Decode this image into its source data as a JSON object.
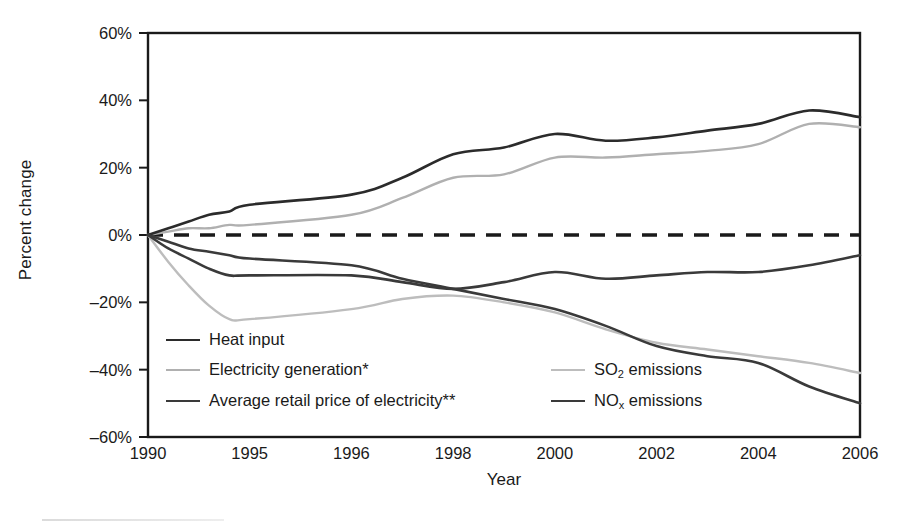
{
  "chart_data": {
    "type": "line",
    "title": "",
    "xlabel": "Year",
    "ylabel": "Percent change",
    "grid": false,
    "legend_position": "inside-bottom-left",
    "x_categories": [
      "1990",
      "1995",
      "1996",
      "1998",
      "2000",
      "2002",
      "2004",
      "2006"
    ],
    "x_note": "Category axis: tick labels evenly spaced although year intervals are unequal",
    "ylim": [
      -60,
      60
    ],
    "ytick_labels": [
      "60%",
      "40%",
      "20%",
      "0%",
      "-20%",
      "-40%",
      "-60%"
    ],
    "ytick_values": [
      60,
      40,
      20,
      0,
      -20,
      -40,
      -60
    ],
    "zero_reference_line": {
      "value": 0,
      "style": "dashed",
      "color": "#1a1a1a"
    },
    "series": [
      {
        "name": "Heat input",
        "color": "#2b2b2b",
        "width": 2.6,
        "values_at_ticks": [
          0,
          9,
          12,
          24,
          30,
          31,
          35,
          35
        ],
        "x": [
          1990,
          1991,
          1992,
          1993,
          1994,
          1995,
          1996,
          1997,
          1998,
          1999,
          2000,
          2001,
          2002,
          2003,
          2004,
          2005,
          2006
        ],
        "y": [
          0,
          2,
          4,
          6,
          7,
          9,
          12,
          17,
          24,
          26,
          30,
          28,
          29,
          31,
          33,
          37,
          35
        ]
      },
      {
        "name": "Electricity generation*",
        "color": "#b0b0b0",
        "width": 2.4,
        "values_at_ticks": [
          0,
          3,
          6,
          17,
          23,
          25,
          28,
          32
        ],
        "x": [
          1990,
          1991,
          1992,
          1993,
          1994,
          1995,
          1996,
          1997,
          1998,
          1999,
          2000,
          2001,
          2002,
          2003,
          2004,
          2005,
          2006
        ],
        "y": [
          0,
          1,
          2,
          2,
          3,
          3,
          6,
          11,
          17,
          18,
          23,
          23,
          24,
          25,
          27,
          33,
          32
        ]
      },
      {
        "name": "Average retail price of electricity**",
        "color": "#3a3a3a",
        "width": 2.6,
        "values_at_ticks": [
          0,
          -7,
          -9,
          -16,
          -22,
          -33,
          -38,
          -50
        ],
        "x": [
          1990,
          1991,
          1992,
          1993,
          1994,
          1995,
          1996,
          1997,
          1998,
          1999,
          2000,
          2001,
          2002,
          2003,
          2004,
          2005,
          2006
        ],
        "y": [
          0,
          -2,
          -4,
          -5,
          -6,
          -7,
          -9,
          -13,
          -16,
          -19,
          -22,
          -27,
          -33,
          -36,
          -38,
          -45,
          -50
        ]
      },
      {
        "name": "SO2 emissions",
        "color": "#bdbdbd",
        "width": 2.4,
        "values_at_ticks": [
          0,
          -25,
          -22,
          -18,
          -23,
          -32,
          -36,
          -41
        ],
        "x": [
          1990,
          1991,
          1992,
          1993,
          1994,
          1995,
          1996,
          1997,
          1998,
          1999,
          2000,
          2001,
          2002,
          2003,
          2004,
          2005,
          2006
        ],
        "y": [
          0,
          -8,
          -15,
          -21,
          -25,
          -25,
          -22,
          -19,
          -18,
          -20,
          -23,
          -28,
          -32,
          -34,
          -36,
          -38,
          -41
        ]
      },
      {
        "name": "NOx emissions",
        "color": "#3a3a3a",
        "width": 2.6,
        "values_at_ticks": [
          0,
          -12,
          -12,
          -16,
          -11,
          -12,
          -11,
          -6
        ],
        "x": [
          1990,
          1991,
          1992,
          1993,
          1994,
          1995,
          1996,
          1997,
          1998,
          1999,
          2000,
          2001,
          2002,
          2003,
          2004,
          2005,
          2006
        ],
        "y": [
          0,
          -4,
          -7,
          -10,
          -12,
          -12,
          -12,
          -14,
          -16,
          -14,
          -11,
          -13,
          -12,
          -11,
          -11,
          -9,
          -6
        ]
      }
    ]
  },
  "axes": {
    "y_title": "Percent change",
    "x_title": "Year",
    "y_ticks": [
      {
        "label": "60%",
        "value": 60
      },
      {
        "label": "40%",
        "value": 40
      },
      {
        "label": "20%",
        "value": 20
      },
      {
        "label": "0%",
        "value": 0
      },
      {
        "label": "-20%",
        "value": -20
      },
      {
        "label": "-40%",
        "value": -40
      },
      {
        "label": "-60%",
        "value": -60
      }
    ],
    "x_ticks": [
      {
        "label": "1990"
      },
      {
        "label": "1995"
      },
      {
        "label": "1996"
      },
      {
        "label": "1998"
      },
      {
        "label": "2000"
      },
      {
        "label": "2002"
      },
      {
        "label": "2004"
      },
      {
        "label": "2006"
      }
    ]
  },
  "legend": {
    "left_column": [
      {
        "label": "Heat input",
        "color": "#2b2b2b",
        "width": 2.6
      },
      {
        "label": "Electricity generation*",
        "color": "#b0b0b0",
        "width": 2.4
      },
      {
        "label": "Average retail price of electricity**",
        "color": "#3a3a3a",
        "width": 2.6
      }
    ],
    "right_column": [
      {
        "label_html": "SO<sub>2</sub> emissions",
        "label": "SO2 emissions",
        "color": "#bdbdbd",
        "width": 2.4
      },
      {
        "label_html": "NO<sub>x</sub> emissions",
        "label": "NOx emissions",
        "color": "#3a3a3a",
        "width": 2.6
      }
    ]
  },
  "colors": {
    "frame": "#1a1a1a",
    "background": "#ffffff",
    "dark_series": "#2b2b2b",
    "mid_series": "#3a3a3a",
    "light_series": "#bdbdbd"
  }
}
